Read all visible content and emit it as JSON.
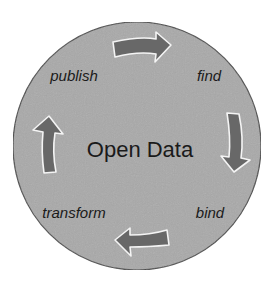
{
  "diagram": {
    "type": "cycle",
    "center": {
      "label": "Open Data"
    },
    "stages": [
      {
        "label": "publish",
        "x": 77,
        "y": 75
      },
      {
        "label": "find",
        "x": 210,
        "y": 76
      },
      {
        "label": "bind",
        "x": 210,
        "y": 213
      },
      {
        "label": "transform",
        "x": 74,
        "y": 213
      }
    ],
    "flow": [
      "publish",
      "find",
      "bind",
      "transform",
      "publish"
    ],
    "arrows": [
      {
        "from": "publish",
        "to": "find",
        "direction": "right"
      },
      {
        "from": "find",
        "to": "bind",
        "direction": "down"
      },
      {
        "from": "bind",
        "to": "transform",
        "direction": "left"
      },
      {
        "from": "transform",
        "to": "publish",
        "direction": "up"
      }
    ],
    "colors": {
      "circle_fill": "#a9a9a9",
      "circle_stroke": "#4a4a4a",
      "arrow_fill": "#686868",
      "arrow_stroke": "#f4f4f4",
      "text": "#1a1a1a"
    }
  }
}
